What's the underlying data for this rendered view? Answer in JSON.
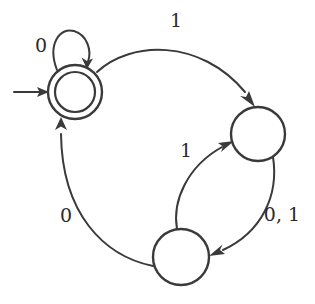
{
  "diagram": {
    "kind": "finite-state-automaton",
    "background_color": "#ffffff",
    "stroke_color": "#3a3a3a",
    "label_color": "#2b2b2b",
    "states": [
      {
        "id": "q0",
        "role": "start-accepting",
        "shape": "double-circle",
        "cx": 75,
        "cy": 92,
        "r_outer": 27,
        "r_inner": 20,
        "label": ""
      },
      {
        "id": "q1",
        "role": "normal",
        "shape": "circle",
        "cx": 258,
        "cy": 134,
        "r_outer": 27,
        "r_inner": 0,
        "label": ""
      },
      {
        "id": "q2",
        "role": "normal",
        "shape": "circle",
        "cx": 181,
        "cy": 257,
        "r_outer": 28,
        "r_inner": 0,
        "label": ""
      }
    ],
    "start_marker": {
      "name": "start-arrow",
      "from_x": 14,
      "to_x": 46,
      "y": 92
    },
    "transitions": [
      {
        "id": "t-self-q0",
        "from": "q0",
        "to": "q0",
        "symbol": "0",
        "label_x": 41,
        "label_y": 47,
        "kind": "self-loop"
      },
      {
        "id": "t-q0-q1",
        "from": "q0",
        "to": "q1",
        "symbol": "1",
        "label_x": 176,
        "label_y": 22,
        "kind": "arc-top"
      },
      {
        "id": "t-q2-q1",
        "from": "q2",
        "to": "q1",
        "symbol": "1",
        "label_x": 186,
        "label_y": 152,
        "kind": "arc-inner-left"
      },
      {
        "id": "t-q1-q2",
        "from": "q1",
        "to": "q2",
        "symbol": "0, 1",
        "label_x": 282,
        "label_y": 216,
        "kind": "arc-outer-right"
      },
      {
        "id": "t-q2-q0",
        "from": "q2",
        "to": "q0",
        "symbol": "0",
        "label_x": 66,
        "label_y": 217,
        "kind": "arc-left"
      }
    ]
  }
}
